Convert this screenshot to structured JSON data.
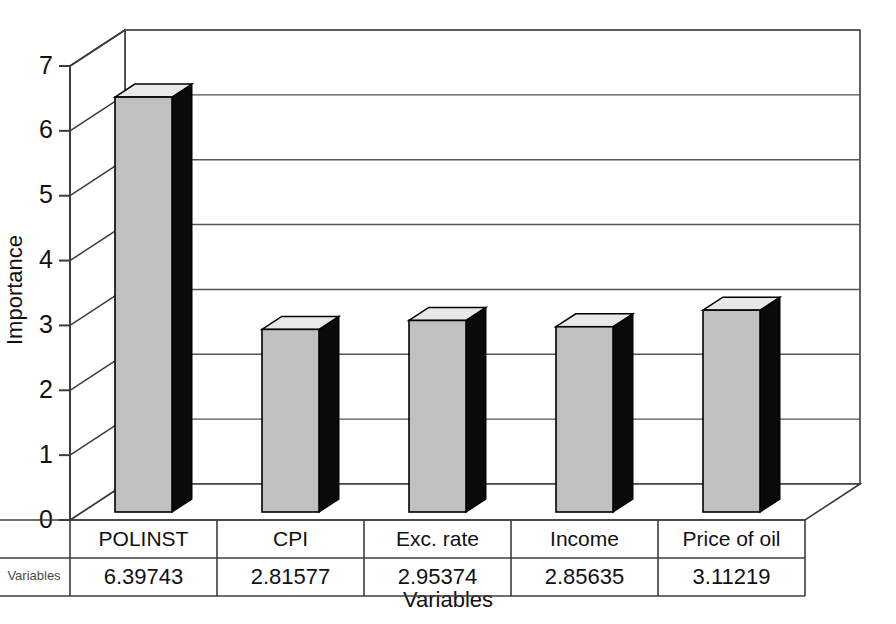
{
  "chart_data": {
    "type": "bar",
    "title": "",
    "subtitle": "",
    "xlabel": "Variables",
    "ylabel": "Importance",
    "categories": [
      "POLINST",
      "CPI",
      "Exc. rate",
      "Income",
      "Price of oil"
    ],
    "values": [
      6.39743,
      2.81577,
      2.95374,
      2.85635,
      3.11219
    ],
    "value_labels": [
      "6.39743",
      "2.81577",
      "2.95374",
      "2.85635",
      "3.11219"
    ],
    "series": [
      {
        "name": "Variables",
        "values": [
          6.39743,
          2.81577,
          2.95374,
          2.85635,
          3.11219
        ]
      }
    ],
    "ylim": [
      0,
      7
    ],
    "yticks": [
      0,
      1,
      2,
      3,
      4,
      5,
      6,
      7
    ],
    "ytick_labels": [
      "0",
      "1",
      "2",
      "3",
      "4",
      "5",
      "6",
      "7"
    ],
    "grid": true,
    "legend": false,
    "legend_position": "none",
    "three_d": true,
    "data_table_visible": true,
    "data_table_row_label": "Variables",
    "colors": {
      "bar_front": "#c0c0c0",
      "bar_side": "#0a0a0a",
      "bar_top": "#e8e8e8",
      "axis": "#3c3c3c",
      "grid": "#555555",
      "background": "#ffffff",
      "text": "#111111"
    }
  },
  "axis": {
    "y_title": "Importance",
    "x_title": "Variables",
    "tick_0": "0",
    "tick_1": "1",
    "tick_2": "2",
    "tick_3": "3",
    "tick_4": "4",
    "tick_5": "5",
    "tick_6": "6",
    "tick_7": "7"
  },
  "table": {
    "row_label": "Variables",
    "headers": [
      "POLINST",
      "CPI",
      "Exc. rate",
      "Income",
      "Price of oil"
    ],
    "values": [
      "6.39743",
      "2.81577",
      "2.95374",
      "2.85635",
      "3.11219"
    ]
  }
}
